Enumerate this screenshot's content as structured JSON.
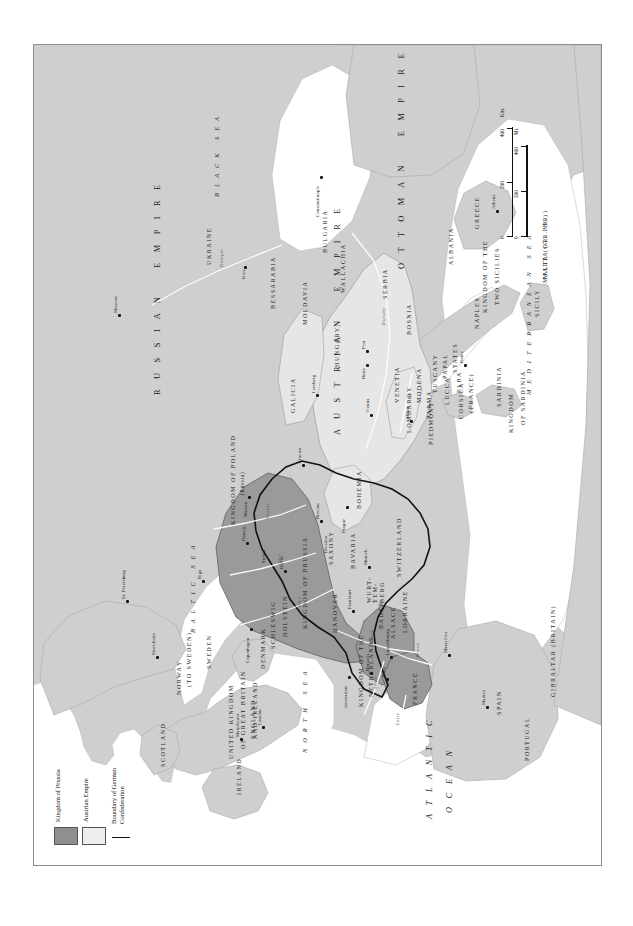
{
  "map": {
    "title_hidden": "",
    "legend": {
      "items": [
        {
          "label": "Kingdom of Prussia",
          "swatch": "fill",
          "color": "#8f8f8f"
        },
        {
          "label": "Austrian Empire",
          "swatch": "fill",
          "color": "#ededed"
        },
        {
          "label": "Boundary of German\nConfederation",
          "swatch": "line",
          "color": "#111111"
        }
      ]
    },
    "scale": {
      "km": {
        "ticks": [
          "0",
          "200",
          "400"
        ],
        "unit": "Km."
      },
      "mi": {
        "ticks": [
          "0",
          "200",
          "400"
        ],
        "unit": "Mi."
      }
    },
    "colors": {
      "land": "#cfcfcf",
      "sea": "#ffffff",
      "prussia": "#9a9a9a",
      "austria": "#e4e4e4",
      "border_frame": "#8d8d8d",
      "confederation_boundary": "#111111",
      "text": "#1a1a1a"
    },
    "empires": [
      {
        "name": "R U S S I A N   E M P I R E"
      },
      {
        "name": "OTTOMAN  EMPIRE"
      },
      {
        "name": "AUSTRIAN  EMPIRE"
      }
    ],
    "regions": [
      "KINGDOM OF POLAND\n(Russia)",
      "UKRAINE",
      "BESSARABIA",
      "MOLDAVIA",
      "WALLACHIA",
      "BULGARIA",
      "SERBIA",
      "ALBANIA",
      "GREECE",
      "GALICIA",
      "HUNGARY",
      "BOSNIA",
      "BOHEMIA",
      "SAXONY",
      "BAVARIA",
      "WURT-\nTEM-\nBERG",
      "BADEN",
      "ALSACE\nLORRAINE",
      "SWITZERLAND",
      "HANOVER",
      "KINGDOM OF PRUSSIA",
      "KINGDOM OF THE\nNETHERLANDS",
      "FRANCE",
      "SPAIN",
      "PORTUGAL",
      "GIBRALTAR (BRITAIN)",
      "UNITED KINGDOM\nOF GREAT BRITAIN\nAND IRELAND",
      "SCOTLAND",
      "ENGLAND",
      "IRELAND",
      "SWEDEN",
      "NORWAY\n(TO SWEDEN)",
      "DENMARK",
      "SCHLESWIG",
      "HOLSTEIN",
      "PIEDMONT",
      "LOMBARDY",
      "VENETIA",
      "PARMA",
      "MODENA",
      "LUCCA",
      "TUSCANY",
      "PAPAL\nSTATES",
      "ELBA",
      "CORSICA\n(FRANCE)",
      "SARDINIA",
      "KINGDOM\nOF SARDINIA",
      "KINGDOM OF THE\nTWO SICILIES",
      "NAPLES",
      "SICILY",
      "MALTA (GR. BR.)"
    ],
    "seas": [
      "ATLANTIC\nOCEAN",
      "NORTH SEA",
      "BALTIC SEA",
      "MEDITERRANEAN SEA",
      "BLACK SEA"
    ],
    "cities": [
      "Moscow",
      "St. Petersburg",
      "Riga",
      "Kiev",
      "Warsaw",
      "Cracow",
      "Stockholm",
      "Copenhagen",
      "Danzig",
      "Berlin",
      "Breslau",
      "Prague",
      "Vienna",
      "Buda",
      "Pest",
      "Lemberg",
      "Constantinople",
      "Athens",
      "Munich",
      "Frankfort",
      "Amsterdam",
      "Brussels",
      "Luxembourg",
      "Paris",
      "Marseilles",
      "Milan",
      "Rome",
      "London",
      "Manchester",
      "Madrid",
      "Dresden",
      "Stettin"
    ],
    "rivers": [
      "Dnieper",
      "Danube",
      "Rhine",
      "Elbe",
      "Oder",
      "Vistula",
      "Loire",
      "Seine",
      "Po",
      "Rhone"
    ],
    "labels": {
      "russian_empire": "R U S S I A N    E M P I R E",
      "ottoman_empire": "O T T O M A N    E M P I R E",
      "austrian_empire": "A U S T R I A N    E M P I R E",
      "kingdom_of_poland": "KINGDOM OF POLAND",
      "kingdom_of_poland_sub": "(Russia)",
      "kingdom_of_prussia": "KINGDOM OF PRUSSIA",
      "kingdom_netherlands": "KINGDOM OF THE",
      "kingdom_netherlands2": "NETHERLANDS",
      "uk1": "UNITED KINGDOM",
      "uk2": "OF GREAT BRITAIN",
      "uk3": "AND IRELAND",
      "norway": "NORWAY",
      "norway_sub": "(TO SWEDEN)",
      "kingdom_sardinia1": "KINGDOM",
      "kingdom_sardinia2": "OF SARDINIA",
      "two_sicilies1": "KINGDOM OF THE",
      "two_sicilies2": "TWO SICILIES",
      "papal1": "PAPAL",
      "papal2": "STATES",
      "corsica1": "CORSICA",
      "corsica2": "(FRANCE)",
      "wurttemberg": "WURT-\nTEM-\nBERG",
      "alsace": "ALSACE",
      "lorraine": "LORRAINE",
      "atlantic1": "A T L A N T I C",
      "atlantic2": "O C E A N",
      "north_sea": "N O R T H   S E A",
      "baltic_sea": "B A L T I C   S E A",
      "med_sea": "M E D I T E R R A N E A N   S E A",
      "black_sea": "B L A C K   S E A",
      "gibraltar": "GIBRALTAR (BRITAIN)",
      "malta": "MALTA (GR. BR.)"
    }
  }
}
